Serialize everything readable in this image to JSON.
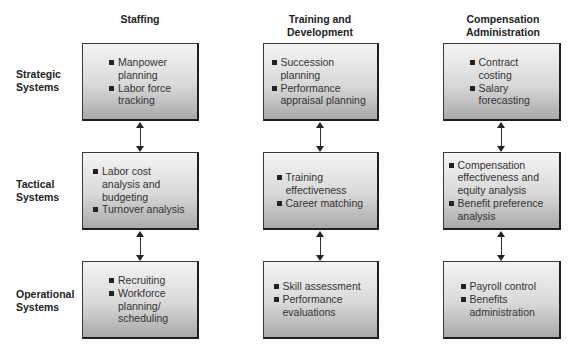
{
  "columns": [
    {
      "title": "Staffing"
    },
    {
      "title": "Training and Development"
    },
    {
      "title": "Compensation Administration"
    }
  ],
  "column_header_lines": [
    [
      "Staffing"
    ],
    [
      "Training and",
      "Development"
    ],
    [
      "Compensation",
      "Administration"
    ]
  ],
  "rows": [
    {
      "label_lines": [
        "Strategic",
        "Systems"
      ]
    },
    {
      "label_lines": [
        "Tactical",
        "Systems"
      ]
    },
    {
      "label_lines": [
        "Operational",
        "Systems"
      ]
    }
  ],
  "cells": {
    "staffing": {
      "strategic": [
        "Manpower planning",
        "Labor force tracking"
      ],
      "tactical": [
        "Labor cost analysis and budgeting",
        "Turnover analysis"
      ],
      "operational": [
        "Recruiting",
        "Workforce planning/ scheduling"
      ]
    },
    "training": {
      "strategic": [
        "Succession planning",
        "Performance appraisal planning"
      ],
      "tactical": [
        "Training effectiveness",
        "Career matching"
      ],
      "operational": [
        "Skill assessment",
        "Performance evaluations"
      ]
    },
    "compensation": {
      "strategic": [
        "Contract costing",
        "Salary forecasting"
      ],
      "tactical": [
        "Compensation effectiveness and equity analysis",
        "Benefit preference analysis"
      ],
      "operational": [
        "Payroll control",
        "Benefits administration"
      ]
    }
  },
  "connectors": {
    "type": "bidirectional-arrow",
    "between": [
      "strategic-tactical",
      "tactical-operational"
    ]
  }
}
